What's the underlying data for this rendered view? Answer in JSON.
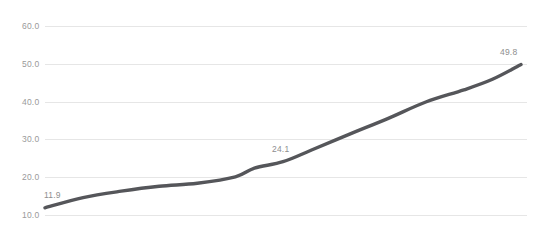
{
  "chart_data": {
    "type": "line",
    "title": "",
    "subtitle": "",
    "xlabel": "",
    "ylabel": "",
    "grid": true,
    "legend": false,
    "legend_position": "none",
    "ylim": [
      10.0,
      60.0
    ],
    "yticks": [
      10.0,
      20.0,
      30.0,
      40.0,
      50.0,
      60.0
    ],
    "ytick_labels": [
      "10.0",
      "20.0",
      "30.0",
      "40.0",
      "50.0",
      "60.0"
    ],
    "xticks": [],
    "xtick_labels": [],
    "series": [
      {
        "name": "",
        "color": "#55565a",
        "x": [
          0,
          8,
          16,
          24,
          32,
          40,
          44,
          50,
          56,
          64,
          72,
          80,
          88,
          94,
          100
        ],
        "values": [
          11.9,
          14.6,
          16.3,
          17.6,
          18.4,
          20.1,
          22.4,
          24.1,
          27.2,
          31.4,
          35.5,
          39.9,
          43.1,
          45.9,
          49.8
        ]
      }
    ],
    "point_labels": [
      {
        "text": "11.9",
        "value": 11.9,
        "x_pct": 0,
        "anchor": "above-right"
      },
      {
        "text": "24.1",
        "value": 24.1,
        "x_pct": 50,
        "anchor": "above"
      },
      {
        "text": "49.8",
        "value": 49.8,
        "x_pct": 100,
        "anchor": "above-left"
      }
    ]
  }
}
